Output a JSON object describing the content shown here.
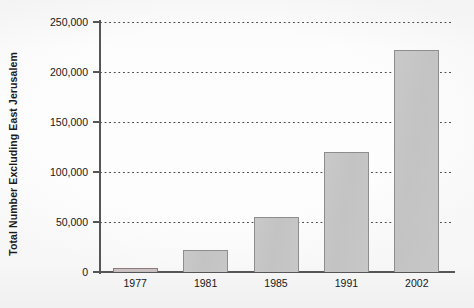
{
  "chart_data": {
    "type": "bar",
    "title": "",
    "subtitle": "",
    "xlabel": "",
    "ylabel": "Total Number Excluding East Jerusalem",
    "categories": [
      "1977",
      "1981",
      "1985",
      "1991",
      "2002"
    ],
    "values": [
      4500,
      22500,
      55000,
      120000,
      222000
    ],
    "series": [
      {
        "name": "Total Number Excluding East Jerusalem",
        "values": [
          4500,
          22500,
          55000,
          120000,
          222000
        ]
      }
    ],
    "ylim": [
      0,
      250000
    ],
    "xlim": null,
    "ytick_values": [
      0,
      50000,
      100000,
      150000,
      200000,
      250000
    ],
    "ytick_labels": [
      "0",
      "50,000",
      "100,000",
      "150,000",
      "200,000",
      "250,000"
    ],
    "xtick_labels": [
      "1977",
      "1981",
      "1985",
      "1991",
      "2002"
    ],
    "grid": "horizontal-dotted",
    "legend": "none",
    "legend_position": "none",
    "annotations": [],
    "colors": {
      "bar_fill": "#c5c5c5",
      "bar_border": "#8d8d8d",
      "first_bar_fill": "#c8bfc1",
      "first_bar_border": "#8d7a80",
      "axis": "#565656",
      "gridline": "#4a4a4a",
      "text": "#171717",
      "background": "#fdfdfd"
    }
  },
  "axes": {
    "y_title": "Total Number Excluding East Jerusalem",
    "y_ticks": [
      {
        "label": "250,000",
        "value": 250000
      },
      {
        "label": "200,000",
        "value": 200000
      },
      {
        "label": "150,000",
        "value": 150000
      },
      {
        "label": "100,000",
        "value": 100000
      },
      {
        "label": "50,000",
        "value": 50000
      },
      {
        "label": "0",
        "value": 0
      }
    ],
    "x_ticks": [
      {
        "label": "1977",
        "value": 4500
      },
      {
        "label": "1981",
        "value": 22500
      },
      {
        "label": "1985",
        "value": 55000
      },
      {
        "label": "1991",
        "value": 120000
      },
      {
        "label": "2002",
        "value": 222000
      }
    ]
  }
}
